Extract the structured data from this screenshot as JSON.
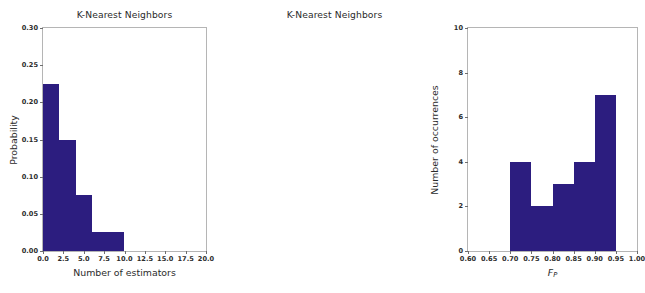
{
  "figure": {
    "background_color": "#ffffff",
    "bar_color": "#2c1d7f",
    "axis_color": "#b5b5b5"
  },
  "panels": [
    {
      "id": "left",
      "title": "K-Nearest Neighbors",
      "xlabel": "Number of estimators",
      "ylabel": "Probability",
      "xticklabels": [
        "0.0",
        "2.5",
        "5.0",
        "7.5",
        "10.0",
        "12.5",
        "15.0",
        "17.5",
        "20.0"
      ],
      "yticklabels": [
        "0.00",
        "0.05",
        "0.10",
        "0.15",
        "0.20",
        "0.25",
        "0.30"
      ]
    },
    {
      "id": "right",
      "title": "K-Nearest Neighbors",
      "xlabel_math": {
        "symbol": "F",
        "subscript": "P"
      },
      "ylabel": "Number of occurrences",
      "xticklabels": [
        "0.60",
        "0.65",
        "0.70",
        "0.75",
        "0.80",
        "0.85",
        "0.90",
        "0.95",
        "1.00"
      ],
      "yticklabels": [
        "0",
        "2",
        "4",
        "6",
        "8",
        "10"
      ]
    }
  ],
  "chart_data": [
    {
      "type": "bar",
      "title": "K-Nearest Neighbors",
      "xlabel": "Number of estimators",
      "ylabel": "Probability",
      "xlim": [
        0.0,
        20.0
      ],
      "ylim": [
        0.0,
        0.3
      ],
      "xticks": [
        0.0,
        2.5,
        5.0,
        7.5,
        10.0,
        12.5,
        15.0,
        17.5,
        20.0
      ],
      "yticks": [
        0.0,
        0.05,
        0.1,
        0.15,
        0.2,
        0.25,
        0.3
      ],
      "grid": false,
      "legend": "none",
      "bin_edges": [
        0,
        2,
        4,
        6,
        10
      ],
      "categories": [
        "0-2",
        "2-4",
        "4-6",
        "6-10"
      ],
      "values": [
        0.225,
        0.15,
        0.075,
        0.025
      ],
      "bar_color": "#2c1d7f"
    },
    {
      "type": "bar",
      "title": "K-Nearest Neighbors",
      "xlabel": "F_P",
      "ylabel": "Number of occurrences",
      "xlim": [
        0.6,
        1.0
      ],
      "ylim": [
        0,
        10
      ],
      "xticks": [
        0.6,
        0.65,
        0.7,
        0.75,
        0.8,
        0.85,
        0.9,
        0.95,
        1.0
      ],
      "yticks": [
        0,
        2,
        4,
        6,
        8,
        10
      ],
      "grid": false,
      "legend": "none",
      "bin_edges": [
        0.7,
        0.75,
        0.8,
        0.85,
        0.9,
        0.95
      ],
      "categories": [
        "0.70-0.75",
        "0.75-0.80",
        "0.80-0.85",
        "0.85-0.90",
        "0.90-0.95"
      ],
      "values": [
        4,
        2,
        3,
        4,
        7
      ],
      "bar_color": "#2c1d7f"
    }
  ]
}
